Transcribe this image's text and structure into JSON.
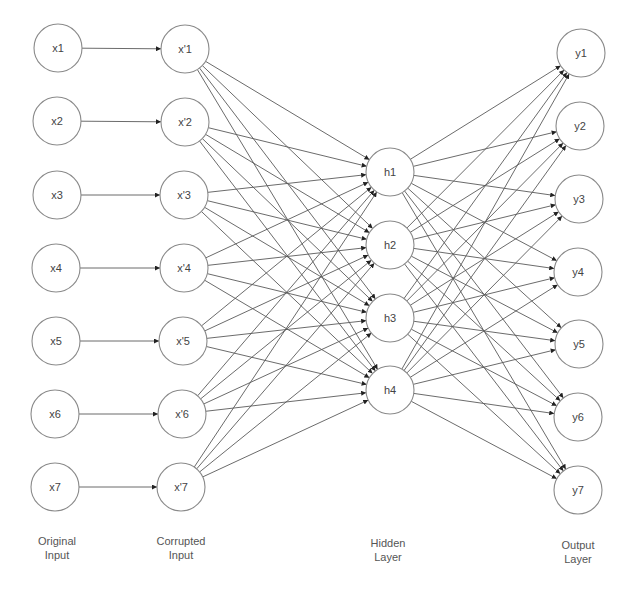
{
  "diagram": {
    "colors": {
      "node_stroke": "#8a8a8a",
      "node_fill": "#ffffff",
      "edge": "#5a5a5a",
      "label": "#444444",
      "layer_label": "#555555"
    },
    "node_radius": 24,
    "layers": [
      {
        "id": "original_input",
        "label_lines": [
          "Original",
          "Input"
        ],
        "label_x": 57,
        "label_y": 541,
        "nodes": [
          {
            "id": "x1",
            "label": "x1",
            "x": 58,
            "y": 48
          },
          {
            "id": "x2",
            "label": "x2",
            "x": 57,
            "y": 121
          },
          {
            "id": "x3",
            "label": "x3",
            "x": 57,
            "y": 195
          },
          {
            "id": "x4",
            "label": "x4",
            "x": 56,
            "y": 268
          },
          {
            "id": "x5",
            "label": "x5",
            "x": 56,
            "y": 341
          },
          {
            "id": "x6",
            "label": "x6",
            "x": 55,
            "y": 414
          },
          {
            "id": "x7",
            "label": "x7",
            "x": 55,
            "y": 487
          }
        ]
      },
      {
        "id": "corrupted_input",
        "label_lines": [
          "Corrupted",
          "Input"
        ],
        "label_x": 181,
        "label_y": 541,
        "nodes": [
          {
            "id": "xc1",
            "label": "x'1",
            "x": 185,
            "y": 49
          },
          {
            "id": "xc2",
            "label": "x'2",
            "x": 185,
            "y": 122
          },
          {
            "id": "xc3",
            "label": "x'3",
            "x": 184,
            "y": 195
          },
          {
            "id": "xc4",
            "label": "x'4",
            "x": 184,
            "y": 268
          },
          {
            "id": "xc5",
            "label": "x'5",
            "x": 183,
            "y": 341
          },
          {
            "id": "xc6",
            "label": "x'6",
            "x": 182,
            "y": 414
          },
          {
            "id": "xc7",
            "label": "x'7",
            "x": 181,
            "y": 487
          }
        ]
      },
      {
        "id": "hidden_layer",
        "label_lines": [
          "Hidden",
          "Layer"
        ],
        "label_x": 388,
        "label_y": 543,
        "nodes": [
          {
            "id": "h1",
            "label": "h1",
            "x": 390,
            "y": 172
          },
          {
            "id": "h2",
            "label": "h2",
            "x": 390,
            "y": 245
          },
          {
            "id": "h3",
            "label": "h3",
            "x": 390,
            "y": 318
          },
          {
            "id": "h4",
            "label": "h4",
            "x": 390,
            "y": 390
          }
        ]
      },
      {
        "id": "output_layer",
        "label_lines": [
          "Output",
          "Layer"
        ],
        "label_x": 578,
        "label_y": 545,
        "nodes": [
          {
            "id": "y1",
            "label": "y1",
            "x": 581,
            "y": 53
          },
          {
            "id": "y2",
            "label": "y2",
            "x": 580,
            "y": 126
          },
          {
            "id": "y3",
            "label": "y3",
            "x": 579,
            "y": 199
          },
          {
            "id": "y4",
            "label": "y4",
            "x": 578,
            "y": 272
          },
          {
            "id": "y5",
            "label": "y5",
            "x": 579,
            "y": 344
          },
          {
            "id": "y6",
            "label": "y6",
            "x": 578,
            "y": 417
          },
          {
            "id": "y7",
            "label": "y7",
            "x": 578,
            "y": 490
          }
        ]
      }
    ],
    "connections": [
      {
        "from_layer": 0,
        "to_layer": 1,
        "mode": "one-to-one"
      },
      {
        "from_layer": 1,
        "to_layer": 2,
        "mode": "fully-connected"
      },
      {
        "from_layer": 2,
        "to_layer": 3,
        "mode": "fully-connected"
      }
    ]
  }
}
